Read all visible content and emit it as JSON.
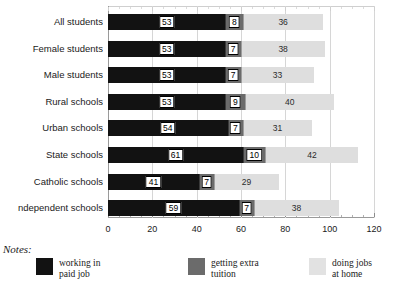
{
  "chart_data": {
    "type": "bar",
    "orientation": "horizontal",
    "stacked": true,
    "title": "",
    "xlabel": "",
    "ylabel": "",
    "xlim": [
      0,
      120
    ],
    "xticks": [
      0,
      20,
      40,
      60,
      80,
      100,
      120
    ],
    "xtick_labels": [
      "0",
      "20",
      "40",
      "60",
      "80",
      "100",
      "120"
    ],
    "minor_tick_step": 5,
    "grid": "vertical",
    "legend_position": "bottom",
    "categories": [
      "All students",
      "Female students",
      "Male students",
      "Rural schools",
      "Urban schools",
      "State schools",
      "Catholic schools",
      "ndependent schools"
    ],
    "series": [
      {
        "name": "working in paid job",
        "color": "#121212",
        "values": [
          53,
          53,
          53,
          53,
          54,
          61,
          41,
          59
        ]
      },
      {
        "name": "getting extra tuition",
        "color": "#6b6b6b",
        "values": [
          8,
          7,
          7,
          9,
          7,
          10,
          7,
          7
        ]
      },
      {
        "name": "doing jobs at home",
        "color": "#dedede",
        "values": [
          36,
          38,
          33,
          40,
          31,
          42,
          29,
          38
        ]
      }
    ],
    "totals": [
      97,
      98,
      93,
      102,
      92,
      113,
      77,
      104
    ]
  },
  "notes": {
    "title": "Notes:",
    "legend": [
      {
        "label_line1": "working in",
        "label_line2": "paid job",
        "swatch": "black-swatch"
      },
      {
        "label_line1": "getting extra",
        "label_line2": "tuition",
        "swatch": "gray-swatch"
      },
      {
        "label_line1": "doing jobs",
        "label_line2": "at home",
        "swatch": "light-gray-swatch"
      }
    ]
  }
}
